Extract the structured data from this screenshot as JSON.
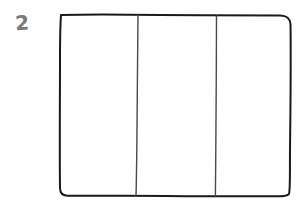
{
  "figure": {
    "number_label": "2",
    "columns": [
      {
        "index": 1,
        "label": ""
      },
      {
        "index": 2,
        "label": ""
      },
      {
        "index": 3,
        "label": ""
      }
    ]
  },
  "colors": {
    "stroke": "#1a1a1a",
    "divider": "#4a4a4a",
    "number": "#7a7a7a",
    "background": "#ffffff"
  }
}
